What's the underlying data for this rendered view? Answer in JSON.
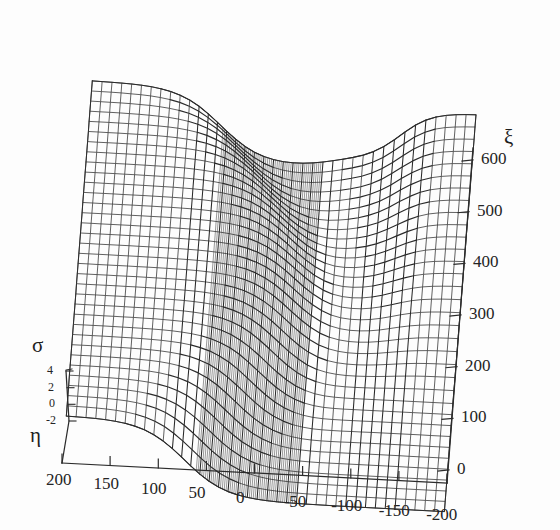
{
  "figure": {
    "kind": "3d-wireframe-surface-plot",
    "background_color": "#fdfdfd",
    "mesh_color": "#3a3a3a",
    "dense_mesh_color": "#2a2a2a",
    "axis_color": "#2b2b2b"
  },
  "axes": {
    "eta": {
      "symbol": "η",
      "orientation": "horizontal-bottom",
      "ticks": [
        "200",
        "150",
        "100",
        "50",
        "0",
        "-50",
        "-100",
        "-150",
        "-200"
      ],
      "tick_values": [
        200,
        150,
        100,
        50,
        0,
        -50,
        -100,
        -150,
        -200
      ],
      "range": [
        200,
        -200
      ]
    },
    "xi": {
      "symbol": "ξ",
      "orientation": "depth-right",
      "ticks": [
        "600",
        "500",
        "400",
        "300",
        "200",
        "100",
        "0"
      ],
      "tick_values": [
        600,
        500,
        400,
        300,
        200,
        100,
        0
      ],
      "range": [
        0,
        600
      ]
    },
    "sigma": {
      "symbol": "σ",
      "orientation": "vertical-left",
      "ticks": [
        "4",
        "2",
        "0",
        "-2"
      ],
      "tick_values": [
        4,
        2,
        0,
        -2
      ],
      "range": [
        -2,
        4
      ]
    }
  },
  "chart_data": {
    "type": "surface",
    "title": "",
    "xlabel": "η",
    "ylabel": "ξ",
    "zlabel": "σ",
    "xlim": [
      -200,
      200
    ],
    "ylim": [
      0,
      650
    ],
    "zlim": [
      -3,
      5
    ],
    "grid": true,
    "legend": false,
    "surface_features": [
      {
        "name": "upper-left-plateau",
        "sigma_level": 4,
        "eta_span": [
          200,
          40
        ]
      },
      {
        "name": "sigmoidal-fold-wall",
        "sigma_level": "transition",
        "eta_span": [
          40,
          -80
        ]
      },
      {
        "name": "lower-right-plateau",
        "sigma_level": -2,
        "eta_span": [
          -80,
          -200
        ]
      },
      {
        "name": "secondary-step-notch",
        "sigma_level": 2,
        "eta_span": [
          -100,
          -200
        ]
      }
    ],
    "mesh_resolution": {
      "eta_lines": 40,
      "xi_lines": 34
    }
  }
}
